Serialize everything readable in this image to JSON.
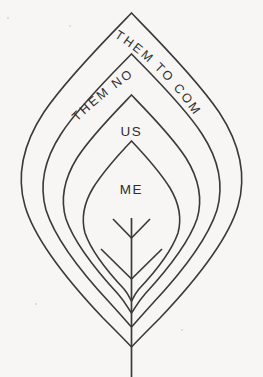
{
  "figure": {
    "background_color": "#f7f6f4",
    "outline_color": "#3a3a3a",
    "labels": {
      "outer": "THEM TO COME",
      "second": "THEM NOW",
      "third": "US",
      "inner": "ME"
    },
    "bands": [
      {
        "name": "them-to-come",
        "label": "THEM TO COME",
        "fill": "#ffffff",
        "order": 1
      },
      {
        "name": "them-now",
        "label": "THEM NOW",
        "fill": "#fbfbfa",
        "order": 2
      },
      {
        "name": "us",
        "label": "US",
        "fill": "#c9c9c9",
        "order": 3
      },
      {
        "name": "me",
        "label": "ME",
        "fill": "#a9a9a9",
        "order": 4
      }
    ],
    "motif": {
      "name": "arrow-stem-motif",
      "description": "vertical stem with two chevron branch pairs"
    }
  }
}
